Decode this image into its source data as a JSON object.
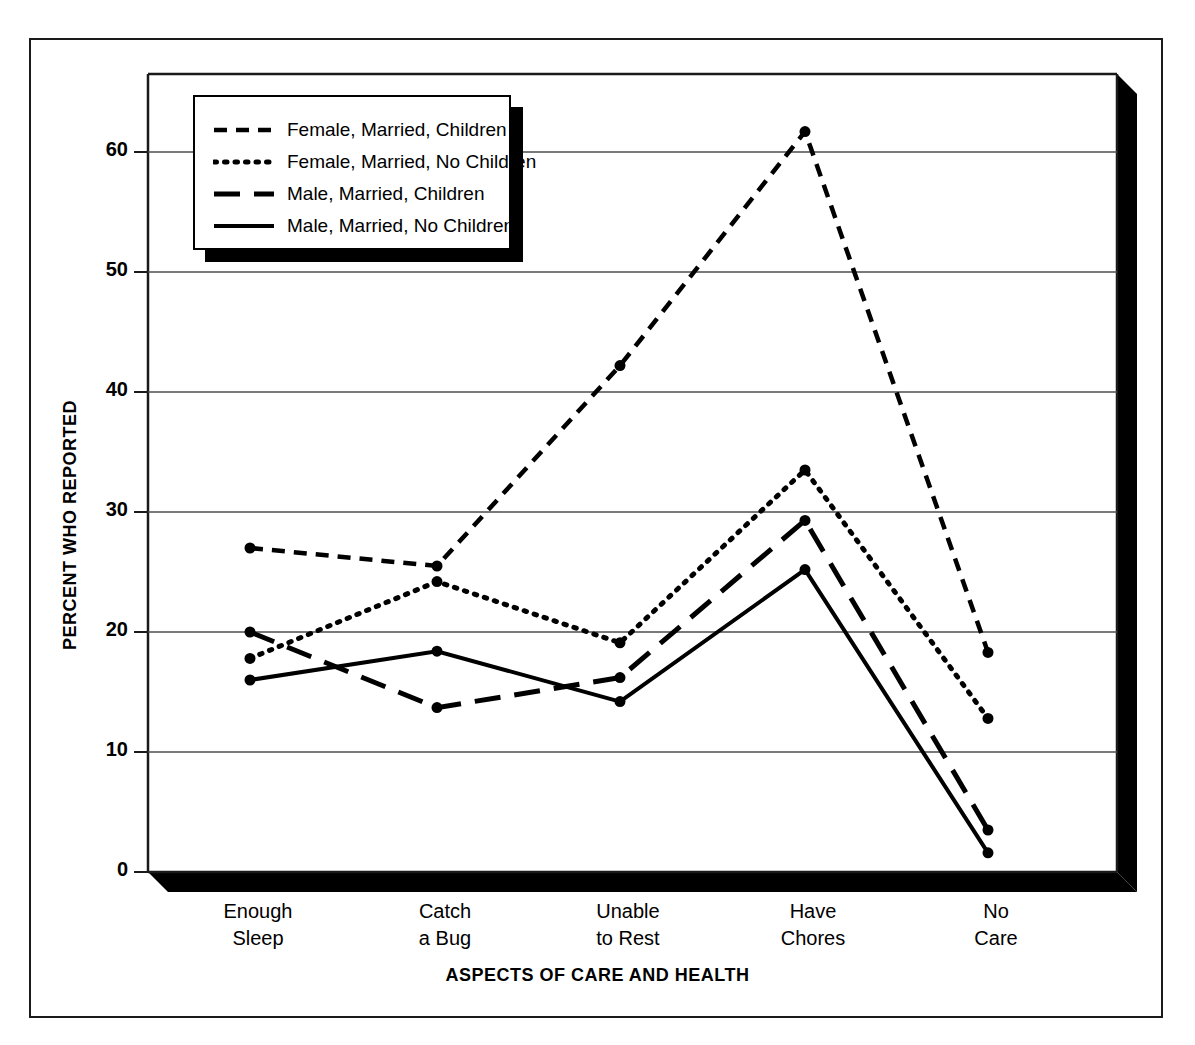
{
  "chart_data": {
    "type": "line",
    "title": "",
    "xlabel": "ASPECTS OF CARE AND HEALTH",
    "ylabel": "PERCENT WHO REPORTED",
    "categories": [
      "Enough\nSleep",
      "Catch\na Bug",
      "Unable\nto Rest",
      "Have\nChores",
      "No\nCare"
    ],
    "category_lines": [
      [
        "Enough",
        "Sleep"
      ],
      [
        "Catch",
        "a Bug"
      ],
      [
        "Unable",
        "to Rest"
      ],
      [
        "Have",
        "Chores"
      ],
      [
        "No",
        "Care"
      ]
    ],
    "yticks": [
      0,
      10,
      20,
      30,
      40,
      50,
      60
    ],
    "ylim": [
      0,
      66
    ],
    "grid": "horizontal",
    "legend_position": "upper-left-inside",
    "series": [
      {
        "name": "Female, Married, Children",
        "style": "dashed",
        "values": [
          27.0,
          25.5,
          42.2,
          61.7,
          18.3
        ]
      },
      {
        "name": "Female, Married, No Children",
        "style": "dotted",
        "values": [
          17.8,
          24.2,
          19.1,
          33.5,
          12.8
        ]
      },
      {
        "name": "Male, Married, Children",
        "style": "long-dashed",
        "values": [
          20.0,
          13.7,
          16.2,
          29.3,
          3.5
        ]
      },
      {
        "name": "Male, Married, No Children",
        "style": "solid",
        "values": [
          16.0,
          18.4,
          14.2,
          25.2,
          1.6
        ]
      }
    ]
  },
  "legend": {
    "items": [
      {
        "label": "Female, Married, Children",
        "style": "dashed"
      },
      {
        "label": "Female, Married, No Children",
        "style": "dotted"
      },
      {
        "label": "Male, Married, Children",
        "style": "long-dashed"
      },
      {
        "label": "Male, Married, No Children",
        "style": "solid"
      }
    ]
  },
  "axes": {
    "y_title": "PERCENT WHO REPORTED",
    "x_title": "ASPECTS OF CARE AND HEALTH",
    "y_tick_labels": [
      "60",
      "50",
      "40",
      "30",
      "20",
      "10",
      "0"
    ]
  },
  "colors": {
    "line": "#000000",
    "grid": "#4d4d4d",
    "frame": "#1a1a1a",
    "shadow": "#000000",
    "background": "#ffffff"
  }
}
